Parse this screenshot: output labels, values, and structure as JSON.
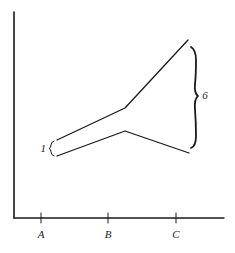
{
  "diagram": {
    "type": "line-diagram",
    "x_axis": {
      "ticks": [
        {
          "label": "A",
          "x": 41
        },
        {
          "label": "B",
          "x": 108
        },
        {
          "label": "C",
          "x": 176
        }
      ]
    },
    "series": [
      {
        "name": "upper-line",
        "points": [
          [
            57,
            140
          ],
          [
            125,
            108
          ],
          [
            188,
            40
          ]
        ]
      },
      {
        "name": "lower-line",
        "points": [
          [
            57,
            156
          ],
          [
            125,
            131
          ],
          [
            189,
            153
          ]
        ]
      }
    ],
    "annotations": {
      "left_gap_label": "1",
      "right_gap_label": "6"
    }
  }
}
